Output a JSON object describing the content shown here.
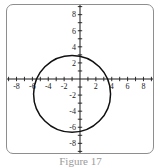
{
  "figure": {
    "caption": "Figure 17",
    "background_color": "#ffffff",
    "frame_color": "#8e8e8e"
  },
  "chart_data": {
    "type": "scatter",
    "title": "",
    "xlabel": "",
    "ylabel": "",
    "xlim": [
      -9.2,
      9.2
    ],
    "ylim": [
      -9.2,
      9.2
    ],
    "grid": false,
    "legend": null,
    "axis_color": "#1a1a1a",
    "curve_color": "#111111",
    "xticks": [
      -9,
      -8,
      -7,
      -6,
      -5,
      -4,
      -3,
      -2,
      -1,
      1,
      2,
      3,
      4,
      5,
      6,
      7,
      8,
      9
    ],
    "yticks": [
      -9,
      -8,
      -7,
      -6,
      -5,
      -4,
      -3,
      -2,
      -1,
      1,
      2,
      3,
      4,
      5,
      6,
      7,
      8,
      9
    ],
    "xtick_labels": [
      {
        "value": -8,
        "text": "-8"
      },
      {
        "value": -6,
        "text": "-6"
      },
      {
        "value": -4,
        "text": "-4"
      },
      {
        "value": -2,
        "text": "-2"
      },
      {
        "value": 2,
        "text": "2"
      },
      {
        "value": 4,
        "text": "4"
      },
      {
        "value": 6,
        "text": "6"
      },
      {
        "value": 8,
        "text": "8"
      }
    ],
    "ytick_labels": [
      {
        "value": 8,
        "text": "8"
      },
      {
        "value": 6,
        "text": "6"
      },
      {
        "value": 4,
        "text": "4"
      },
      {
        "value": 2,
        "text": "2"
      },
      {
        "value": -2,
        "text": "-2"
      },
      {
        "value": -4,
        "text": "-4"
      },
      {
        "value": -6,
        "text": "-6"
      },
      {
        "value": -8,
        "text": "-8"
      }
    ],
    "series": [
      {
        "name": "circle",
        "shape": "circle",
        "center_x": -1.0,
        "center_y": -1.85,
        "radius": 4.85,
        "x_intercepts": [
          -4.3,
          2.3
        ],
        "y_intercepts": [
          3.0,
          -6.7
        ],
        "stroke_width": 1.5
      }
    ]
  }
}
